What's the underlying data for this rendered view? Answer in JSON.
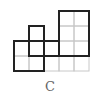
{
  "figure": {
    "label": "C",
    "grid": {
      "origin_x": 14,
      "origin_y": 11,
      "cell": 15,
      "cols": 5,
      "rows": 4,
      "line_color": "#c8c8c8"
    },
    "thin_cells": [
      [
        0,
        2
      ],
      [
        1,
        2
      ],
      [
        0,
        3
      ],
      [
        1,
        3
      ],
      [
        1,
        1
      ],
      [
        2,
        2
      ],
      [
        2,
        3
      ],
      [
        3,
        3
      ],
      [
        4,
        3
      ],
      [
        3,
        0
      ],
      [
        4,
        0
      ],
      [
        3,
        1
      ],
      [
        4,
        1
      ],
      [
        3,
        2
      ],
      [
        4,
        2
      ]
    ],
    "bold_shapes": [
      {
        "name": "left-square",
        "points": "14,41 44,41 44,71 14,71"
      },
      {
        "name": "middle-step",
        "points": "29,26 44,26 44,41 59,41 59,56 29,56"
      },
      {
        "name": "right-rectangle",
        "points": "59,11 89,11 89,56 59,56"
      }
    ],
    "bold_color": "#222222"
  }
}
